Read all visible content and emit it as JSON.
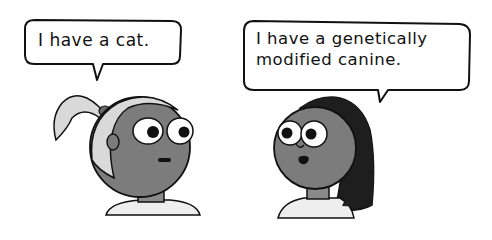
{
  "comic": {
    "panel_description": "Two cartoon characters facing each other with speech bubbles",
    "left_character": {
      "name": "ponytail-girl",
      "speech": "I have a cat."
    },
    "right_character": {
      "name": "long-hair-girl",
      "speech_line1": "I have a genetically",
      "speech_line2": "modified canine."
    }
  },
  "colors": {
    "background": "#ffffff",
    "outline": "#111111",
    "skin": "#7c7c7c",
    "light_hair": "#d9d9d9",
    "dark_hair": "#1e1e1e",
    "shirt": "#eeeeee",
    "neck": "#8a8a8a"
  }
}
